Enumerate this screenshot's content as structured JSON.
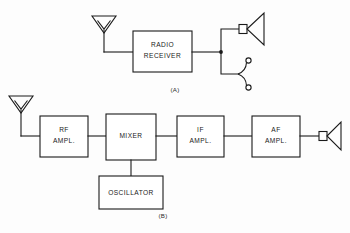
{
  "figure": {
    "background_color": "#fdfdfd",
    "line_color": "#1a1a1a",
    "text_color": "#1a1a1a"
  },
  "diagram_a": {
    "caption": "(A)",
    "antenna_label": "antenna",
    "blocks": [
      {
        "id": "radio-receiver",
        "line1": "RADIO",
        "line2": "RECEIVER"
      }
    ],
    "outputs": [
      {
        "id": "loudspeaker",
        "label": "loudspeaker"
      },
      {
        "id": "headphone-jack",
        "label": "headphone jack"
      }
    ]
  },
  "diagram_b": {
    "caption": "(B)",
    "antenna_label": "antenna",
    "blocks": [
      {
        "id": "rf-ampl",
        "line1": "RF",
        "line2": "AMPL."
      },
      {
        "id": "mixer",
        "line1": "MIXER",
        "line2": ""
      },
      {
        "id": "if-ampl",
        "line1": "IF",
        "line2": "AMPL."
      },
      {
        "id": "af-ampl",
        "line1": "AF",
        "line2": "AMPL."
      },
      {
        "id": "oscillator",
        "line1": "OSCILLATOR",
        "line2": ""
      }
    ],
    "outputs": [
      {
        "id": "loudspeaker",
        "label": "loudspeaker"
      }
    ]
  }
}
